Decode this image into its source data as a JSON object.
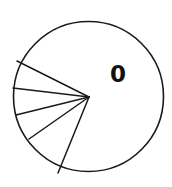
{
  "figure": {
    "background_color": "#ffffff",
    "stroke_color": "#1a1a1a",
    "width": 172,
    "height": 187
  },
  "labels": {
    "large_slice_label": "0"
  },
  "chart_data": {
    "type": "pie",
    "title": "",
    "subtitle": "",
    "xlabel": "",
    "ylabel": "",
    "legend_position": "none",
    "grid": false,
    "center_x": 88.5,
    "center_y": 96.5,
    "radius": 75,
    "wedge_origin_x": 89,
    "wedge_origin_y": 97,
    "stroke_color": "#1a1a1a",
    "fill_color": "#ffffff",
    "start_angle_deg": 153.4,
    "direction": "clockwise-downward",
    "categories": [
      "0",
      "1",
      "2",
      "3",
      "4",
      "5"
    ],
    "values": [
      74.4,
      19.8,
      20.6,
      21.2,
      32.8,
      91.2
    ],
    "labels_shown": [
      "0"
    ],
    "boundary_angles_deg": [
      153.4,
      173.2,
      193.8,
      215.0,
      247.8
    ],
    "boundary_endpoints": [
      {
        "x": 17,
        "y": 61
      },
      {
        "x": 13,
        "y": 88
      },
      {
        "x": 16,
        "y": 115
      },
      {
        "x": 29,
        "y": 139
      },
      {
        "x": 58,
        "y": 173
      }
    ],
    "label_positions": [
      {
        "label": "0",
        "x": 110,
        "y": 63
      }
    ]
  }
}
